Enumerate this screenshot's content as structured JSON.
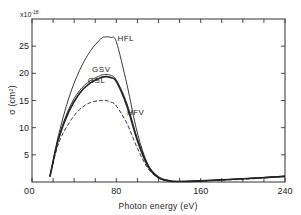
{
  "chart_data": {
    "type": "line",
    "title": "",
    "xlabel": "Photon energy  (eV)",
    "ylabel": "σ (cm²)",
    "y_multiplier": "x10⁻¹⁸",
    "xlim": [
      0,
      240
    ],
    "ylim": [
      0,
      30
    ],
    "x_ticks": [
      0,
      80,
      160,
      240
    ],
    "x_tick_labels": [
      "0",
      "80",
      "160",
      "240"
    ],
    "x_minor_ticks": [
      20,
      40,
      60,
      100,
      120,
      140,
      180,
      200,
      220
    ],
    "y_ticks": [
      0,
      5,
      10,
      15,
      20,
      25
    ],
    "y_tick_labels": [
      "0",
      "5",
      "10",
      "15",
      "20",
      "25"
    ],
    "grid": false,
    "legend": "inline curve labels",
    "x": [
      17,
      25,
      35,
      45,
      55,
      65,
      70,
      75,
      80,
      90,
      100,
      110,
      120,
      130,
      140,
      160,
      200,
      240
    ],
    "series": [
      {
        "name": "HFL",
        "style": "solid-thin",
        "values": [
          1.0,
          8.5,
          15.5,
          20.5,
          24.0,
          26.3,
          26.7,
          26.6,
          25.8,
          18.0,
          9.0,
          3.2,
          0.8,
          0.2,
          0.1,
          0.2,
          0.6,
          1.1
        ]
      },
      {
        "name": "GSV",
        "style": "solid-thin",
        "values": [
          1.0,
          8.0,
          13.5,
          16.8,
          18.6,
          19.6,
          19.8,
          19.6,
          18.8,
          14.5,
          8.0,
          3.2,
          1.0,
          0.3,
          0.1,
          0.2,
          0.6,
          1.1
        ]
      },
      {
        "name": "GSL",
        "style": "solid-thick",
        "values": [
          1.0,
          7.8,
          13.0,
          16.3,
          18.2,
          19.2,
          19.4,
          19.2,
          18.5,
          14.0,
          7.6,
          2.9,
          0.8,
          0.2,
          0.1,
          0.2,
          0.6,
          1.0
        ]
      },
      {
        "name": "HFV",
        "style": "dashed",
        "values": [
          1.0,
          7.0,
          10.8,
          13.3,
          14.6,
          15.0,
          15.0,
          14.7,
          14.0,
          10.8,
          6.2,
          2.5,
          0.7,
          0.2,
          0.1,
          0.2,
          0.5,
          1.0
        ]
      }
    ],
    "annotations": [
      {
        "text": "HFL",
        "x": 81,
        "y": 26
      },
      {
        "text": "GSV",
        "x": 57,
        "y": 20.3
      },
      {
        "text": "GSL",
        "x": 53,
        "y": 18.3
      },
      {
        "text": "HFV",
        "x": 90,
        "y": 12.3
      }
    ]
  }
}
